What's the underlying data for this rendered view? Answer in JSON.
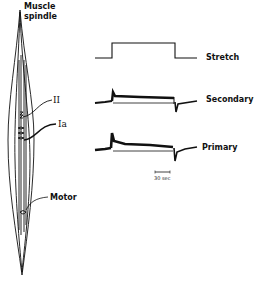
{
  "figure": {
    "spindle_title_line1": "Muscle",
    "spindle_title_line2": "spindle",
    "fiber_labels": {
      "secondary_fiber": "II",
      "primary_fiber": "Ia",
      "motor_fiber": "Motor"
    },
    "traces": [
      {
        "id": "stretch",
        "label": "Stretch"
      },
      {
        "id": "secondary",
        "label": "Secondary"
      },
      {
        "id": "primary",
        "label": "Primary"
      }
    ],
    "scale_bar": {
      "label": "30 sec"
    },
    "colors": {
      "ink": "#111111",
      "background": "#ffffff"
    }
  }
}
